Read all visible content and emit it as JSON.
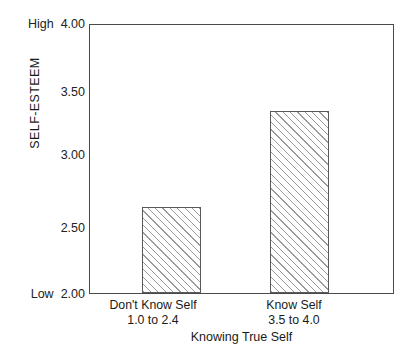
{
  "chart_data": {
    "type": "bar",
    "title": "",
    "subtitle": "",
    "xlabel": "Knowing True Self",
    "ylabel": "SELF-ESTEEM",
    "categories": [
      "Don't Know Self",
      "Know Self"
    ],
    "category_sublabels": [
      "1.0 to 2.4",
      "3.5 to 4.0"
    ],
    "values": [
      2.64,
      3.36
    ],
    "ylim": [
      2.0,
      4.0
    ],
    "yticks": [
      "2.00",
      "2.50",
      "3.00",
      "3.50",
      "4.00"
    ],
    "ytick_values": [
      2.0,
      2.5,
      3.0,
      3.5,
      4.0
    ],
    "axis_low_label": "Low",
    "axis_high_label": "High",
    "grid": false,
    "legend": null,
    "bar_fill": "hatched-diagonal",
    "bar_edge_color": "#5a5a5a",
    "frame_color": "#4a4a4a"
  },
  "ticks": {
    "t400": "4.00",
    "t350": "3.50",
    "t300": "3.00",
    "t250": "2.50",
    "t200": "2.00",
    "high": "High",
    "low": "Low"
  },
  "bars": {
    "b0": {
      "label_line1": "Don't Know Self",
      "label_line2": "1.0 to 2.4",
      "value": "2.64"
    },
    "b1": {
      "label_line1": "Know Self",
      "label_line2": "3.5 to 4.0",
      "value": "3.36"
    }
  },
  "axes": {
    "y_title": "SELF-ESTEEM",
    "x_title": "Knowing True Self"
  }
}
